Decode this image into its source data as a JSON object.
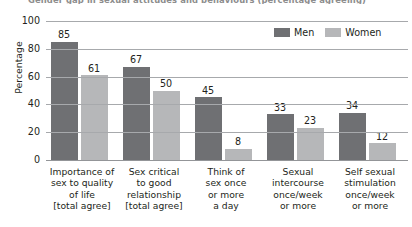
{
  "figure": {
    "title_clipped": "Gender gap in sexual attitudes and behaviours (percentage agreeing)",
    "ylabel": "Percentage"
  },
  "legend": {
    "position": "top-right",
    "items": [
      {
        "label": "Men",
        "color": "#6f7073",
        "swatch_icon": "legend-swatch-icon"
      },
      {
        "label": "Women",
        "color": "#b6b7b9",
        "swatch_icon": "legend-swatch-icon"
      }
    ]
  },
  "axis": {
    "yticks": [
      "0",
      "20",
      "40",
      "60",
      "80",
      "100"
    ]
  },
  "categories_lines": [
    [
      "Importance of",
      "sex to quality",
      "of life",
      "[total agree]"
    ],
    [
      "Sex critical",
      "to good",
      "relationship",
      "[total agree]"
    ],
    [
      "Think of",
      "sex once",
      "or more",
      "a day"
    ],
    [
      "Sexual",
      "intercourse",
      "once/week",
      "or more"
    ],
    [
      "Self sexual",
      "stimulation",
      "once/week",
      "or more"
    ]
  ],
  "chart_data": {
    "type": "bar",
    "title": "Gender gap in sexual attitudes and behaviours (percentage agreeing)",
    "xlabel": "",
    "ylabel": "Percentage",
    "ylim": [
      0,
      100
    ],
    "yticks": [
      0,
      20,
      40,
      60,
      80,
      100
    ],
    "grid": true,
    "legend_position": "top-right",
    "categories": [
      "Importance of sex to quality of life [total agree]",
      "Sex critical to good relationship [total agree]",
      "Think of sex once or more a day",
      "Sexual intercourse once/week or more",
      "Self sexual stimulation once/week or more"
    ],
    "series": [
      {
        "name": "Men",
        "color": "#6f7073",
        "values": [
          85,
          67,
          45,
          33,
          34
        ]
      },
      {
        "name": "Women",
        "color": "#b6b7b9",
        "values": [
          61,
          50,
          8,
          23,
          12
        ]
      }
    ]
  }
}
